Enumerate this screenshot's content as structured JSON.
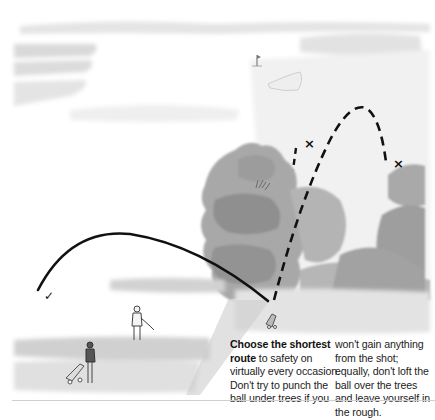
{
  "illustration": {
    "subject": "golf-course-escape-from-trees",
    "marks": {
      "good_shot": "✓",
      "bad_shot_1": "×",
      "bad_shot_2": "×"
    },
    "colors": {
      "trajectory": "#111111",
      "foliage": "#9a9a9a",
      "fairway": "#d4d4d4",
      "sky": "#e6e6e6"
    }
  },
  "caption": {
    "bold_lead": "Choose the shortest route",
    "col1_rest": " to safety on virtually every occasion. Don't try to punch the ball under trees if you",
    "col2": "won't gain anything from the shot; equally, don't loft the ball over the trees and leave yourself in the rough."
  }
}
